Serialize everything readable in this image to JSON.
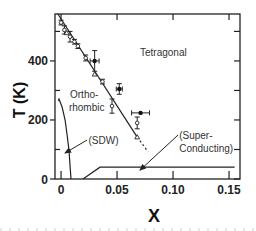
{
  "chart_data": {
    "type": "scatter",
    "title": "",
    "xlabel": "X",
    "ylabel": "T (K)",
    "xlim": [
      -0.0054,
      0.1598
    ],
    "ylim": [
      0,
      559
    ],
    "grid": false,
    "legend": null,
    "x_ticks": [
      {
        "value": 0,
        "label": "0"
      },
      {
        "value": 0.05,
        "label": "0.05"
      },
      {
        "value": 0.1,
        "label": "0.10"
      },
      {
        "value": 0.15,
        "label": "0.15"
      }
    ],
    "y_ticks_major": [
      {
        "value": 0,
        "label": "0"
      },
      {
        "value": 200,
        "label": "200"
      },
      {
        "value": 400,
        "label": "400"
      }
    ],
    "y_ticks_minor": [
      100,
      300,
      500
    ],
    "series": [
      {
        "name": "structural transition (open circles)",
        "marker": "open-circle",
        "points": [
          {
            "x": 0.0,
            "y": 530,
            "yerr": 8
          },
          {
            "x": 0.003,
            "y": 505,
            "yerr": 14
          },
          {
            "x": 0.008,
            "y": 482,
            "yerr": 18
          },
          {
            "x": 0.012,
            "y": 465,
            "yerr": 8
          },
          {
            "x": 0.015,
            "y": 450,
            "yerr": 8
          },
          {
            "x": 0.022,
            "y": 410,
            "yerr": 10
          },
          {
            "x": 0.037,
            "y": 330,
            "yerr": 8
          },
          {
            "x": 0.0455,
            "y": 247,
            "yerr": 24
          },
          {
            "x": 0.068,
            "y": 190,
            "yerr": 20
          }
        ]
      },
      {
        "name": "structural transition (triangles)",
        "marker": "open-triangle",
        "points": [
          {
            "x": 0.005,
            "y": 495
          },
          {
            "x": 0.03,
            "y": 355
          },
          {
            "x": 0.068,
            "y": 142
          }
        ]
      },
      {
        "name": "structural transition (filled, with x/y error)",
        "marker": "filled-circle",
        "points": [
          {
            "x": 0.03,
            "y": 400,
            "yerr": 35,
            "xerr": 0.004
          },
          {
            "x": 0.052,
            "y": 305,
            "yerr": 18,
            "xerr": 0.0027
          },
          {
            "x": 0.071,
            "y": 224,
            "yerr": 0,
            "xerr": 0.008
          }
        ]
      }
    ],
    "lines": [
      {
        "name": "orthorhombic-tetragonal boundary",
        "style": "solid",
        "points": [
          [
            -0.003,
            560
          ],
          [
            0.068,
            142
          ]
        ]
      },
      {
        "name": "orthorhombic-tetragonal boundary extrapolation",
        "style": "dashed",
        "points": [
          [
            0.068,
            142
          ],
          [
            0.0777,
            92
          ]
        ]
      },
      {
        "name": "SDW boundary",
        "style": "solid",
        "points": [
          [
            -0.0025,
            265
          ],
          [
            -0.0018,
            271
          ],
          [
            0.0009,
            244
          ],
          [
            0.0036,
            200
          ],
          [
            0.0054,
            149
          ],
          [
            0.0071,
            98
          ],
          [
            0.008,
            47
          ],
          [
            0.0089,
            0
          ]
        ]
      },
      {
        "name": "superconducting boundary",
        "style": "solid",
        "points": [
          [
            0.0196,
            0
          ],
          [
            0.0348,
            40
          ],
          [
            0.155,
            40
          ]
        ]
      }
    ],
    "arrows": [
      {
        "name": "sdw-arrow",
        "from": [
          0.0232,
          132
        ],
        "to": [
          0.0036,
          88
        ]
      },
      {
        "name": "superconducting-arrow",
        "from": [
          0.1045,
          149
        ],
        "to": [
          0.0705,
          30
        ]
      }
    ],
    "annotations": [
      {
        "name": "tetragonal-label",
        "text": "Tetragonal",
        "x": 0.0705,
        "y": 430
      },
      {
        "name": "orthorhombic-label-line1",
        "text": "Ortho-",
        "x": 0.008,
        "y": 285
      },
      {
        "name": "orthorhombic-label-line2",
        "text": "rhombic",
        "x": 0.007,
        "y": 241
      },
      {
        "name": "sdw-label",
        "text": "(SDW)",
        "x": 0.0245,
        "y": 132
      },
      {
        "name": "superconducting-label-line1",
        "text": "(Super-",
        "x": 0.1055,
        "y": 149
      },
      {
        "name": "superconducting-label-line2",
        "text": "Conducting)",
        "x": 0.1055,
        "y": 102
      }
    ]
  }
}
